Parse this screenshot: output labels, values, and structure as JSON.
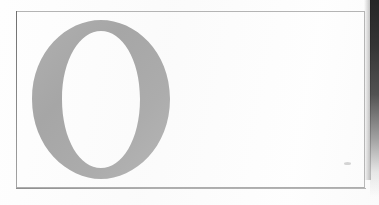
{
  "document": {
    "kind": "scanned-page-fragment",
    "caption": "O",
    "width": 379,
    "height": 205
  },
  "dropcap": {
    "letter": "O",
    "icon_name": "letter-o-glyph",
    "style": "serif-drop-cap",
    "ink_color": "#a9a9a9",
    "ink_color_light": "#bcbcbc",
    "ink_color_dark": "#9a9a9a",
    "left": 32,
    "top": 20,
    "width": 138,
    "height": 159
  },
  "frame": {
    "name": "page-rule-frame",
    "left": 16,
    "top": 11,
    "width": 349,
    "height": 177,
    "line_color": "#b0b0b0",
    "line_color_left": "#8c8c8c"
  },
  "page": {
    "background_color": "#fefefe",
    "margin_color": "#ffffff"
  },
  "artifacts": {
    "edge_shadow": {
      "name": "scan-edge-shadow",
      "side": "right",
      "width": 9,
      "color": "#141414"
    },
    "speck": {
      "name": "scan-dust-speck",
      "left": 344,
      "top": 162,
      "color": "#cdcdcd"
    }
  }
}
